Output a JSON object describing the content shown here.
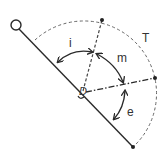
{
  "diagram": {
    "labels": {
      "i": "i",
      "m": "m",
      "e": "e",
      "T": "T",
      "center": "D"
    },
    "colors": {
      "stroke": "#2a2a2a",
      "dashed": "#555555",
      "background": "#ffffff"
    }
  }
}
